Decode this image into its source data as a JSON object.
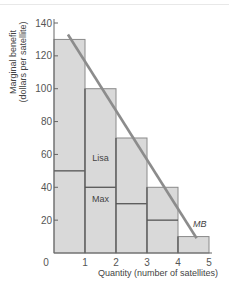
{
  "chart_data": {
    "type": "bar",
    "title": "",
    "xlabel": "Quantity (number of satellites)",
    "ylabel": "Marginal benefit",
    "ylabel_sub": "(dollars per satellite)",
    "x_ticks": [
      "0",
      "1",
      "2",
      "3",
      "4",
      "5"
    ],
    "y_ticks": [
      "20",
      "40",
      "60",
      "80",
      "100",
      "120",
      "140"
    ],
    "ylim": [
      0,
      140
    ],
    "xlim": [
      0,
      5
    ],
    "categories": [
      "1st",
      "2nd",
      "3rd",
      "4th",
      "5th"
    ],
    "series": [
      {
        "name": "Max",
        "values": [
          50,
          40,
          30,
          20,
          10
        ]
      },
      {
        "name": "Lisa",
        "values": [
          80,
          60,
          40,
          20,
          0
        ]
      }
    ],
    "totals": [
      130,
      100,
      70,
      40,
      10
    ],
    "mb_line": {
      "label": "MB",
      "x": [
        0.45,
        4.6
      ],
      "y": [
        133,
        9
      ]
    },
    "bar_labels": {
      "lisa": "Lisa",
      "max": "Max"
    },
    "grid": false,
    "colors": {
      "bar_fill": "#d9d9d9",
      "bar_edge": "#8a8a8a",
      "divider": "#555555",
      "mb_line": "#8c8c8c"
    }
  }
}
